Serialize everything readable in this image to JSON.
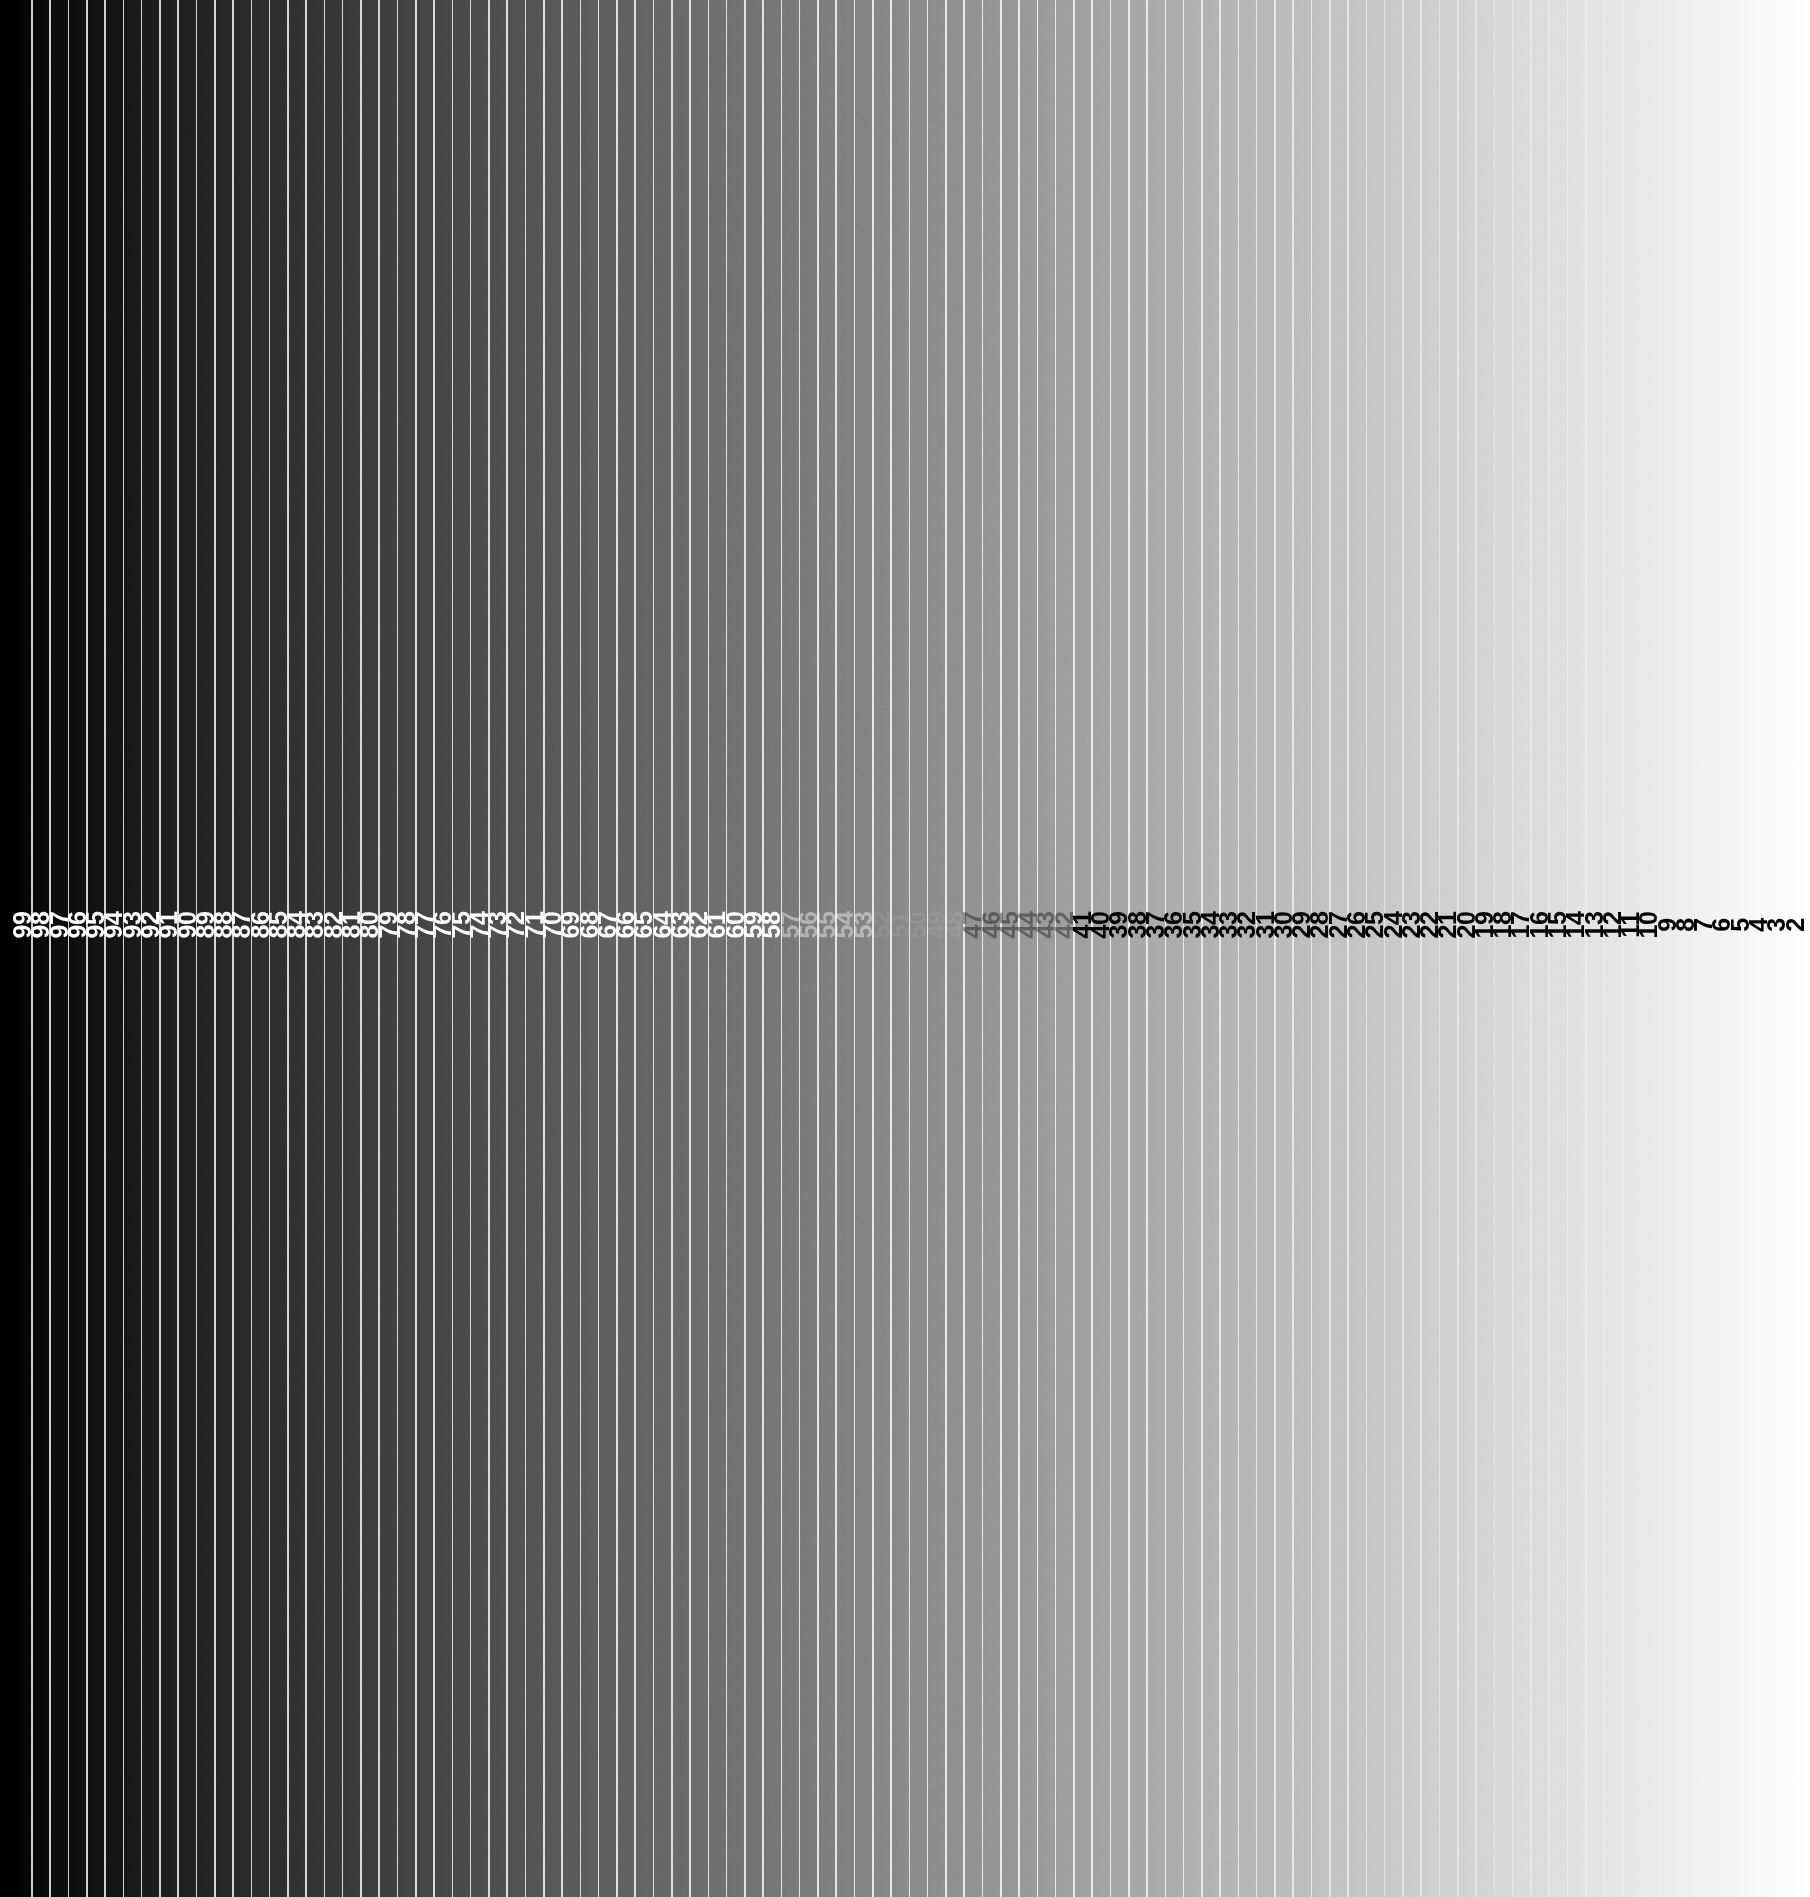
{
  "figure": {
    "kind": "grayscale-step-wedge",
    "width": 1810,
    "height": 1897,
    "background_color": "#000000"
  },
  "ramp": {
    "direction": "left-to-right",
    "start_color": "#000000",
    "end_color": "#ffffff",
    "rule_color": "#ffffff",
    "rule_opacity": 0.8,
    "rule_width_px": 1.6,
    "left_gutter_px": 20,
    "step_pitch_px": 18.28,
    "first_label_center_x": 22,
    "last_label_center_x": 1795,
    "label_center_y": 925,
    "label_rotation_deg": -90,
    "label_font_size_px": 25,
    "label_font_weight": 700,
    "label_light_color": "#ffffff",
    "label_dark_color": "#000000",
    "label_invisible_range": [
      52,
      47
    ]
  },
  "chart_data": {
    "type": "bar",
    "subtitle": "",
    "xlabel": "",
    "ylabel": "",
    "grid": false,
    "legend": null,
    "orientation": "vertical-strips",
    "axis_note": "Step index decreases left to right from 99 to 2; luminance increases left to right from 0% to 100%.",
    "categories": [
      "99",
      "98",
      "97",
      "96",
      "95",
      "94",
      "93",
      "92",
      "91",
      "90",
      "89",
      "88",
      "87",
      "86",
      "85",
      "84",
      "83",
      "82",
      "81",
      "80",
      "79",
      "78",
      "77",
      "76",
      "75",
      "74",
      "73",
      "72",
      "71",
      "70",
      "69",
      "68",
      "67",
      "66",
      "65",
      "64",
      "63",
      "62",
      "61",
      "60",
      "59",
      "58",
      "57",
      "56",
      "55",
      "54",
      "53",
      "52",
      "51",
      "50",
      "49",
      "48",
      "47",
      "46",
      "45",
      "44",
      "43",
      "42",
      "41",
      "40",
      "39",
      "38",
      "37",
      "36",
      "35",
      "34",
      "33",
      "32",
      "31",
      "30",
      "29",
      "28",
      "27",
      "26",
      "25",
      "24",
      "23",
      "22",
      "21",
      "20",
      "19",
      "18",
      "17",
      "16",
      "15",
      "14",
      "13",
      "12",
      "11",
      "10",
      "9",
      "8",
      "7",
      "6",
      "5",
      "4",
      "3",
      "2"
    ],
    "values": [
      1,
      2,
      3,
      4,
      5,
      6,
      7,
      8,
      9,
      10,
      11,
      12,
      13,
      14,
      15,
      16,
      17,
      18,
      19,
      20,
      21,
      22,
      23,
      24,
      25,
      26,
      27,
      28,
      29,
      30,
      31,
      32,
      33,
      34,
      35,
      36,
      37,
      38,
      39,
      40,
      41,
      42,
      43,
      44,
      45,
      46,
      47,
      48,
      49,
      50,
      51,
      52,
      53,
      54,
      55,
      56,
      57,
      58,
      59,
      60,
      61,
      62,
      63,
      64,
      65,
      66,
      67,
      68,
      69,
      70,
      71,
      72,
      73,
      74,
      75,
      76,
      77,
      78,
      79,
      80,
      81,
      82,
      83,
      84,
      85,
      86,
      87,
      88,
      89,
      90,
      91,
      92,
      93,
      94,
      95,
      96,
      97,
      98
    ],
    "ylim": [
      0,
      100
    ],
    "value_unit": "percent-luminance"
  },
  "labels": [
    {
      "text": "99",
      "x": 22,
      "tone": "light"
    },
    {
      "text": "98",
      "x": 40,
      "tone": "light"
    },
    {
      "text": "97",
      "x": 59,
      "tone": "light"
    },
    {
      "text": "96",
      "x": 77,
      "tone": "light"
    },
    {
      "text": "95",
      "x": 95,
      "tone": "light"
    },
    {
      "text": "94",
      "x": 113,
      "tone": "light"
    },
    {
      "text": "93",
      "x": 132,
      "tone": "light"
    },
    {
      "text": "92",
      "x": 150,
      "tone": "light"
    },
    {
      "text": "91",
      "x": 168,
      "tone": "light"
    },
    {
      "text": "90",
      "x": 187,
      "tone": "light"
    },
    {
      "text": "89",
      "x": 205,
      "tone": "light"
    },
    {
      "text": "88",
      "x": 223,
      "tone": "light"
    },
    {
      "text": "87",
      "x": 241,
      "tone": "light"
    },
    {
      "text": "86",
      "x": 260,
      "tone": "light"
    },
    {
      "text": "85",
      "x": 278,
      "tone": "light"
    },
    {
      "text": "84",
      "x": 296,
      "tone": "light"
    },
    {
      "text": "83",
      "x": 314,
      "tone": "light"
    },
    {
      "text": "82",
      "x": 333,
      "tone": "light"
    },
    {
      "text": "81",
      "x": 351,
      "tone": "light"
    },
    {
      "text": "80",
      "x": 369,
      "tone": "light"
    },
    {
      "text": "79",
      "x": 388,
      "tone": "light"
    },
    {
      "text": "78",
      "x": 406,
      "tone": "light"
    },
    {
      "text": "77",
      "x": 424,
      "tone": "light"
    },
    {
      "text": "76",
      "x": 442,
      "tone": "light"
    },
    {
      "text": "75",
      "x": 461,
      "tone": "light"
    },
    {
      "text": "74",
      "x": 479,
      "tone": "light"
    },
    {
      "text": "73",
      "x": 497,
      "tone": "light"
    },
    {
      "text": "72",
      "x": 515,
      "tone": "light"
    },
    {
      "text": "71",
      "x": 534,
      "tone": "light"
    },
    {
      "text": "70",
      "x": 552,
      "tone": "light"
    },
    {
      "text": "69",
      "x": 570,
      "tone": "light"
    },
    {
      "text": "68",
      "x": 589,
      "tone": "light"
    },
    {
      "text": "67",
      "x": 607,
      "tone": "light"
    },
    {
      "text": "66",
      "x": 625,
      "tone": "light"
    },
    {
      "text": "65",
      "x": 643,
      "tone": "light"
    },
    {
      "text": "64",
      "x": 662,
      "tone": "light"
    },
    {
      "text": "63",
      "x": 680,
      "tone": "light"
    },
    {
      "text": "62",
      "x": 698,
      "tone": "light"
    },
    {
      "text": "61",
      "x": 716,
      "tone": "light"
    },
    {
      "text": "60",
      "x": 735,
      "tone": "light"
    },
    {
      "text": "59",
      "x": 753,
      "tone": "light"
    },
    {
      "text": "58",
      "x": 771,
      "tone": "light"
    },
    {
      "text": "57",
      "x": 790,
      "tone": "light-faint"
    },
    {
      "text": "56",
      "x": 808,
      "tone": "light-faint"
    },
    {
      "text": "55",
      "x": 826,
      "tone": "light-faint"
    },
    {
      "text": "54",
      "x": 844,
      "tone": "light-faint"
    },
    {
      "text": "53",
      "x": 863,
      "tone": "light-faint"
    },
    {
      "text": "52",
      "x": 881,
      "tone": "hidden"
    },
    {
      "text": "51",
      "x": 899,
      "tone": "hidden"
    },
    {
      "text": "50",
      "x": 917,
      "tone": "hidden"
    },
    {
      "text": "49",
      "x": 936,
      "tone": "hidden"
    },
    {
      "text": "48",
      "x": 954,
      "tone": "hidden"
    },
    {
      "text": "47",
      "x": 972,
      "tone": "dark-faint"
    },
    {
      "text": "46",
      "x": 991,
      "tone": "dark-faint"
    },
    {
      "text": "45",
      "x": 1009,
      "tone": "dark-faint"
    },
    {
      "text": "44",
      "x": 1027,
      "tone": "dark-faint"
    },
    {
      "text": "43",
      "x": 1045,
      "tone": "dark-faint"
    },
    {
      "text": "42",
      "x": 1064,
      "tone": "dark-faint"
    },
    {
      "text": "41",
      "x": 1082,
      "tone": "dark"
    },
    {
      "text": "40",
      "x": 1100,
      "tone": "dark"
    },
    {
      "text": "39",
      "x": 1118,
      "tone": "dark"
    },
    {
      "text": "38",
      "x": 1137,
      "tone": "dark"
    },
    {
      "text": "37",
      "x": 1155,
      "tone": "dark"
    },
    {
      "text": "36",
      "x": 1173,
      "tone": "dark"
    },
    {
      "text": "35",
      "x": 1192,
      "tone": "dark"
    },
    {
      "text": "34",
      "x": 1210,
      "tone": "dark"
    },
    {
      "text": "33",
      "x": 1228,
      "tone": "dark"
    },
    {
      "text": "32",
      "x": 1246,
      "tone": "dark"
    },
    {
      "text": "31",
      "x": 1265,
      "tone": "dark"
    },
    {
      "text": "30",
      "x": 1283,
      "tone": "dark"
    },
    {
      "text": "29",
      "x": 1301,
      "tone": "dark"
    },
    {
      "text": "28",
      "x": 1319,
      "tone": "dark"
    },
    {
      "text": "27",
      "x": 1338,
      "tone": "dark"
    },
    {
      "text": "26",
      "x": 1356,
      "tone": "dark"
    },
    {
      "text": "25",
      "x": 1374,
      "tone": "dark"
    },
    {
      "text": "24",
      "x": 1393,
      "tone": "dark"
    },
    {
      "text": "23",
      "x": 1411,
      "tone": "dark"
    },
    {
      "text": "22",
      "x": 1429,
      "tone": "dark"
    },
    {
      "text": "21",
      "x": 1447,
      "tone": "dark"
    },
    {
      "text": "20",
      "x": 1466,
      "tone": "dark"
    },
    {
      "text": "19",
      "x": 1484,
      "tone": "dark"
    },
    {
      "text": "18",
      "x": 1502,
      "tone": "dark"
    },
    {
      "text": "17",
      "x": 1520,
      "tone": "dark"
    },
    {
      "text": "16",
      "x": 1539,
      "tone": "dark"
    },
    {
      "text": "15",
      "x": 1557,
      "tone": "dark"
    },
    {
      "text": "14",
      "x": 1575,
      "tone": "dark"
    },
    {
      "text": "13",
      "x": 1594,
      "tone": "dark"
    },
    {
      "text": "12",
      "x": 1612,
      "tone": "dark"
    },
    {
      "text": "11",
      "x": 1630,
      "tone": "dark"
    },
    {
      "text": "10",
      "x": 1648,
      "tone": "dark"
    },
    {
      "text": "9",
      "x": 1667,
      "tone": "dark"
    },
    {
      "text": "8",
      "x": 1685,
      "tone": "dark"
    },
    {
      "text": "7",
      "x": 1703,
      "tone": "dark"
    },
    {
      "text": "6",
      "x": 1721,
      "tone": "dark"
    },
    {
      "text": "5",
      "x": 1740,
      "tone": "dark"
    },
    {
      "text": "4",
      "x": 1758,
      "tone": "dark"
    },
    {
      "text": "3",
      "x": 1776,
      "tone": "dark"
    },
    {
      "text": "2",
      "x": 1795,
      "tone": "dark"
    }
  ]
}
